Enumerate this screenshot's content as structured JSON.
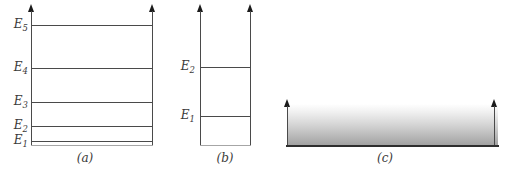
{
  "colors": {
    "bg": "#ffffff",
    "line-color": "#4a4a4a",
    "level-color": "#4a4a4a",
    "edge-color": "#a6a6a6",
    "arrow-color": "#1b1b1b",
    "label-color": "#3a3a3a",
    "baseline-color": "#2e2e2e",
    "band-top": "#ffffff",
    "band-bottom": "#a2a2a2"
  },
  "figure": {
    "panels": {
      "a": {
        "caption": "(a)",
        "levels": [
          {
            "base": "E",
            "sub": "5"
          },
          {
            "base": "E",
            "sub": "4"
          },
          {
            "base": "E",
            "sub": "3"
          },
          {
            "base": "E",
            "sub": "2"
          },
          {
            "base": "E",
            "sub": "1"
          }
        ]
      },
      "b": {
        "caption": "(b)",
        "levels": [
          {
            "base": "E",
            "sub": "2"
          },
          {
            "base": "E",
            "sub": "1"
          }
        ]
      },
      "c": {
        "caption": "(c)"
      }
    }
  }
}
